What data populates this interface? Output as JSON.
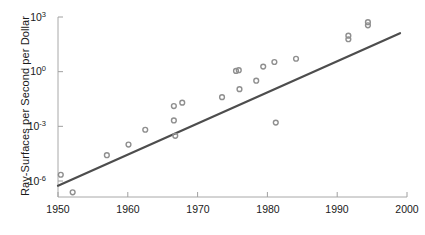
{
  "chart_data": {
    "type": "scatter",
    "title": "",
    "xlabel": "",
    "ylabel": "Ray-Surfaces per Second per Dollar",
    "xlim": [
      1950,
      2000
    ],
    "ylim": [
      1e-07,
      1000
    ],
    "yscale": "log",
    "xscale": "linear",
    "grid": false,
    "legend": null,
    "xticks": [
      1950,
      1960,
      1970,
      1980,
      1990,
      2000
    ],
    "xticklabels": [
      "1950",
      "1960",
      "1970",
      "1980",
      "1990",
      "2000"
    ],
    "yticks": [
      1e-06,
      0.001,
      1,
      1000
    ],
    "yticklabels": [
      "10-6",
      "10-3",
      "100",
      "103"
    ],
    "ytick_mantissa": [
      "10",
      "10",
      "10",
      "10"
    ],
    "ytick_exponent": [
      "-6",
      "-3",
      "0",
      "3"
    ],
    "series": [
      {
        "name": "observations",
        "type": "scatter",
        "marker": "circle",
        "color": "#8f8f8f",
        "points": [
          {
            "x": 1950.4,
            "y": 2.2e-06
          },
          {
            "x": 1952.1,
            "y": 2.4e-07
          },
          {
            "x": 1957.0,
            "y": 2.6e-05
          },
          {
            "x": 1960.1,
            "y": 0.0001
          },
          {
            "x": 1962.5,
            "y": 0.00065
          },
          {
            "x": 1966.6,
            "y": 0.013
          },
          {
            "x": 1967.8,
            "y": 0.02
          },
          {
            "x": 1966.6,
            "y": 0.0021
          },
          {
            "x": 1966.8,
            "y": 0.0003
          },
          {
            "x": 1973.5,
            "y": 0.04
          },
          {
            "x": 1975.5,
            "y": 1.1
          },
          {
            "x": 1975.9,
            "y": 1.2
          },
          {
            "x": 1976.0,
            "y": 0.11
          },
          {
            "x": 1978.4,
            "y": 0.32
          },
          {
            "x": 1979.4,
            "y": 1.9
          },
          {
            "x": 1981.0,
            "y": 3.4
          },
          {
            "x": 1981.2,
            "y": 0.0016
          },
          {
            "x": 1984.1,
            "y": 5.1
          },
          {
            "x": 1991.6,
            "y": 60.0
          },
          {
            "x": 1991.6,
            "y": 95.0
          },
          {
            "x": 1994.4,
            "y": 350.0
          },
          {
            "x": 1994.4,
            "y": 520.0
          }
        ]
      },
      {
        "name": "trend-line",
        "type": "line",
        "color": "#4d4d4d",
        "points": [
          {
            "x": 1950.0,
            "y": 5.5e-07
          },
          {
            "x": 1999.0,
            "y": 130.0
          }
        ]
      }
    ]
  },
  "axes": {
    "tick_color": "#a0a0a0",
    "axis_color": "#a8a8a8"
  }
}
